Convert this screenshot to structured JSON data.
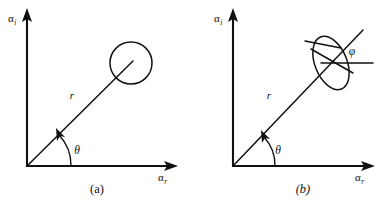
{
  "figure": {
    "background_color": "#ffffff",
    "ink_color": "#111111",
    "panels": [
      {
        "id": "a",
        "caption": "(a)",
        "caption_style": "roman",
        "axes": {
          "y_label_base": "α",
          "y_label_sub": "i",
          "x_label_base": "α",
          "x_label_sub": "r",
          "origin": {
            "x": 27,
            "y": 166
          },
          "y_tip": {
            "x": 27,
            "y": 10
          },
          "x_tip": {
            "x": 176,
            "y": 166
          }
        },
        "vector": {
          "label": "r",
          "label_pos": {
            "x": 76,
            "y": 95
          },
          "tip": {
            "x": 131,
            "y": 62
          },
          "angle_deg": 45
        },
        "angle_theta": {
          "label": "θ",
          "label_pos": {
            "x": 80,
            "y": 150
          },
          "arc_radius": 44,
          "arrow": true
        },
        "shape": {
          "kind": "circle",
          "center": {
            "x": 131,
            "y": 63
          },
          "radius": 21
        }
      },
      {
        "id": "b",
        "caption": "(b)",
        "caption_style": "italic",
        "axes": {
          "y_label_base": "α",
          "y_label_sub": "i",
          "x_label_base": "α",
          "x_label_sub": "r",
          "origin": {
            "x": 233,
            "y": 166
          },
          "y_tip": {
            "x": 233,
            "y": 10
          },
          "x_tip": {
            "x": 373,
            "y": 166
          }
        },
        "vector": {
          "label": "r",
          "label_pos": {
            "x": 272,
            "y": 95
          },
          "tip": {
            "x": 360,
            "y": 33
          },
          "angle_deg": 45
        },
        "angle_theta": {
          "label": "θ",
          "label_pos": {
            "x": 281,
            "y": 150
          },
          "arc_radius": 42,
          "arrow": true
        },
        "angle_phi": {
          "label": "φ",
          "label_pos": {
            "x": 351,
            "y": 52
          },
          "reference_line": {
            "x1": 321,
            "y1": 63,
            "x2": 373,
            "y2": 63
          }
        },
        "shape": {
          "kind": "ellipse",
          "center": {
            "x": 331,
            "y": 63
          },
          "semi_major": 28,
          "semi_minor": 16,
          "rotation_deg": 68,
          "has_internal_axes": true
        }
      }
    ]
  }
}
